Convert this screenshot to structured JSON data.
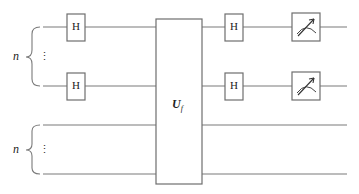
{
  "diagram": {
    "type": "quantum-circuit",
    "registers": [
      {
        "label": "n",
        "dots": "⋮",
        "qubit_wires": 2
      },
      {
        "label": "n",
        "dots": "⋮",
        "qubit_wires": 2
      }
    ],
    "gates": {
      "hadamard_label": "H",
      "oracle_label": "U",
      "oracle_subscript": "f",
      "measurement": "meter-icon"
    },
    "colors": {
      "wire": "#7a7a7a",
      "box_stroke": "#6e6e6e",
      "text": "#222222",
      "background": "#ffffff"
    }
  }
}
